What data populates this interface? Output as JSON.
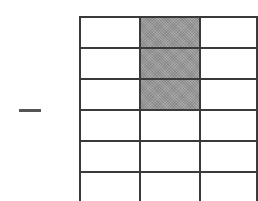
{
  "diagram": {
    "type": "fraction-grid",
    "operator_symbol": "minus",
    "grid": {
      "rows": 6,
      "columns": 3,
      "shaded_cells": [
        [
          0,
          1
        ],
        [
          1,
          1
        ],
        [
          2,
          1
        ]
      ],
      "shaded_count": 3,
      "total_cells": 18
    },
    "colors": {
      "grid_line": "#3a3a3a",
      "shaded_fill": "#9a9a9a",
      "background": "#ffffff",
      "minus_sign": "#555555"
    }
  }
}
